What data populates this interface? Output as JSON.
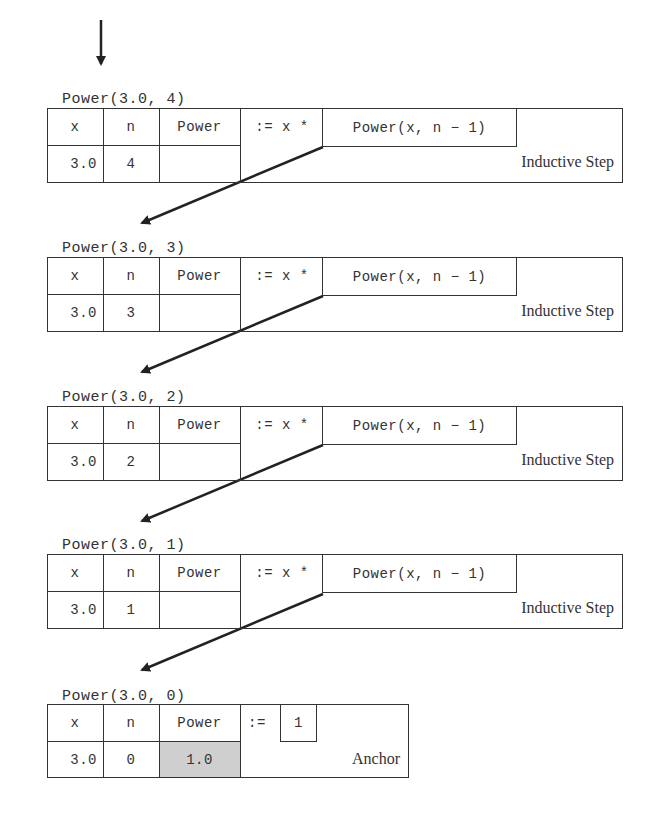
{
  "frames": [
    {
      "title": "Power(3.0, 4)",
      "headers": {
        "x": "x",
        "n": "n",
        "power": "Power"
      },
      "assign": ":= x *",
      "call": "Power(x, n − 1)",
      "values": {
        "x": "3.0",
        "n": "4",
        "power": ""
      },
      "label": "Inductive Step"
    },
    {
      "title": "Power(3.0, 3)",
      "headers": {
        "x": "x",
        "n": "n",
        "power": "Power"
      },
      "assign": ":= x *",
      "call": "Power(x, n − 1)",
      "values": {
        "x": "3.0",
        "n": "3",
        "power": ""
      },
      "label": "Inductive Step"
    },
    {
      "title": "Power(3.0, 2)",
      "headers": {
        "x": "x",
        "n": "n",
        "power": "Power"
      },
      "assign": ":= x *",
      "call": "Power(x, n − 1)",
      "values": {
        "x": "3.0",
        "n": "2",
        "power": ""
      },
      "label": "Inductive Step"
    },
    {
      "title": "Power(3.0, 1)",
      "headers": {
        "x": "x",
        "n": "n",
        "power": "Power"
      },
      "assign": ":= x *",
      "call": "Power(x, n − 1)",
      "values": {
        "x": "3.0",
        "n": "1",
        "power": ""
      },
      "label": "Inductive Step"
    }
  ],
  "anchor": {
    "title": "Power(3.0, 0)",
    "headers": {
      "x": "x",
      "n": "n",
      "power": "Power"
    },
    "assign": ":=",
    "value_box": "1",
    "values": {
      "x": "3.0",
      "n": "0",
      "power": "1.0"
    },
    "label": "Anchor",
    "shade_color": "#cfcfcf"
  },
  "entry_arrow": "down-arrow-icon"
}
